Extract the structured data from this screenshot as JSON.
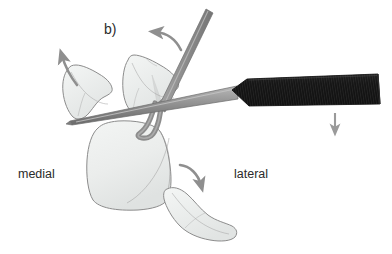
{
  "figure": {
    "type": "medical-illustration",
    "panel_letter": "b)",
    "background_color": "#ffffff",
    "width": 392,
    "height": 254
  },
  "labels": {
    "medial": "medial",
    "lateral": "lateral"
  },
  "colors": {
    "bone_fill": "#eceeed",
    "bone_fill_shadow": "#dfe2e1",
    "bone_outline": "#8c8c8c",
    "metal_shaft": "#8f8f8f",
    "metal_shaft_light": "#b4b4b4",
    "metal_shaft_dark": "#6e6e6e",
    "handle_dark": "#1b1b1b",
    "handle_rib": "#3a3a3a",
    "arrow_gray": "#8f8f8f",
    "text": "#2b2b2b"
  },
  "instruments": [
    {
      "name": "osteotome",
      "description": "black ribbed handle with tapered gray metal blade entering from lower right toward upper left",
      "handle_color": "#1b1b1b",
      "blade_color": "#8f8f8f"
    },
    {
      "name": "elevator",
      "description": "straight gray metal instrument angled from top right down to the fragment",
      "color": "#8f8f8f"
    },
    {
      "name": "bone-hook",
      "description": "curved gray hook retractor beneath the central fragment",
      "color": "#8f8f8f"
    }
  ],
  "bone_fragments": [
    {
      "name": "medial-fragment",
      "description": "small wing-shaped fragment upper left, rotating counterclockwise"
    },
    {
      "name": "central-fragment",
      "description": "fragment above the main body engaged by the elevator"
    },
    {
      "name": "main-body",
      "description": "large rounded bone body occupying the center"
    },
    {
      "name": "lateral-fragment",
      "description": "elongated fragment lower right, rotating into place"
    }
  ],
  "arrows": [
    {
      "name": "arrow-medial-rotation",
      "style": "curved",
      "direction": "counterclockwise-up-left"
    },
    {
      "name": "arrow-central-rotation",
      "style": "curved",
      "direction": "counterclockwise-left"
    },
    {
      "name": "arrow-lateral-rotation",
      "style": "curved",
      "direction": "clockwise-down"
    },
    {
      "name": "arrow-handle-downward-force",
      "style": "straight",
      "direction": "down"
    }
  ]
}
